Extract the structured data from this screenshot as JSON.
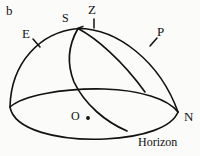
{
  "figure": {
    "panel_label": "b",
    "caption_label": "Horizon",
    "background_color": "#fbfbf9",
    "line_color": "#111111",
    "points": [
      {
        "key": "east",
        "label": "E",
        "has_tick": true,
        "description": "east-point-on-horizon-circle"
      },
      {
        "key": "south",
        "label": "S",
        "has_tick": false,
        "description": "south-point-label-near-apex"
      },
      {
        "key": "zenith",
        "label": "Z",
        "has_tick": true,
        "description": "zenith-point"
      },
      {
        "key": "pole",
        "label": "P",
        "has_tick": true,
        "description": "celestial-pole"
      },
      {
        "key": "north",
        "label": "N",
        "has_tick": false,
        "description": "north-point-on-horizon"
      },
      {
        "key": "origin",
        "label": "O",
        "has_tick": false,
        "description": "observer-center-of-sphere"
      }
    ],
    "curves": [
      {
        "key": "dome-arc",
        "name": "hemisphere-outline"
      },
      {
        "key": "horizon-ellipse",
        "name": "horizon-plane-circle"
      },
      {
        "key": "meridian",
        "name": "great-circle-through-pole"
      },
      {
        "key": "ecliptic",
        "name": "great-circle-steep"
      }
    ]
  }
}
